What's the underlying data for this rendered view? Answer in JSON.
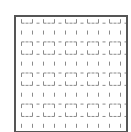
{
  "figure": {
    "type": "dashed-grid-pattern",
    "border_color": "#555555",
    "mark_color": "#8a8a8a",
    "columns": 10,
    "rows": 11,
    "pattern_rows": [
      "corner-bottom",
      "vertical-tick",
      "corner-top"
    ]
  }
}
